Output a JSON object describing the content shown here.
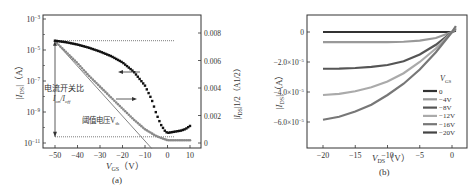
{
  "chart_data": [
    {
      "panel": "(a)",
      "type": "scatter",
      "title": "",
      "xlabel": "V_GS (V)",
      "ylabel_left": "|I_DS| (A)",
      "ylabel_right": "|I_DS|^1/2 (A^1/2)",
      "x_ticks": [
        "-50",
        "-40",
        "-30",
        "-20",
        "-10",
        "0",
        "10"
      ],
      "y_left_ticks": [
        "10^-3",
        "10^-5",
        "10^-7",
        "10^-9",
        "10^-11"
      ],
      "y_right_ticks": [
        "0.008",
        "0.006",
        "0.004",
        "0.002",
        "0"
      ],
      "xlim": [
        -55,
        12
      ],
      "ylim_left_log": [
        -11,
        -3
      ],
      "ylim_right": [
        -0.0003,
        0.0088
      ],
      "annotations": [
        "电流开关比",
        "I_on/I_off",
        "阈值电压V_th"
      ],
      "series": [
        {
          "name": "|I_DS| (log, left axis)",
          "marker": "square-black",
          "x": [
            -50,
            -45,
            -40,
            -35,
            -30,
            -25,
            -20,
            -15,
            -10,
            -7,
            -5,
            -3,
            -1,
            0,
            2,
            4,
            6,
            8,
            10
          ],
          "log10_y": [
            -4.4,
            -4.5,
            -4.65,
            -4.85,
            -5.1,
            -5.4,
            -5.8,
            -6.4,
            -7.3,
            -8.2,
            -9.1,
            -9.8,
            -10.25,
            -10.35,
            -10.3,
            -10.25,
            -10.2,
            -10.1,
            -9.9
          ]
        },
        {
          "name": "|I_DS|^1/2 (linear, right axis)",
          "marker": "circle-grey",
          "x": [
            -50,
            -45,
            -40,
            -35,
            -30,
            -25,
            -20,
            -15,
            -10,
            -5,
            0,
            5,
            10
          ],
          "values": [
            0.0074,
            0.0066,
            0.0058,
            0.0049,
            0.0041,
            0.0033,
            0.0025,
            0.0017,
            0.001,
            0.0005,
            0.0002,
            0.0002,
            0.0002
          ]
        }
      ],
      "reference_lines": {
        "I_on_level_log10": -4.4,
        "I_off_level_log10": -10.6,
        "threshold_voltage_x_intercept": -10
      }
    },
    {
      "panel": "(b)",
      "type": "line",
      "title": "",
      "xlabel": "V_DS (V)",
      "ylabel": "|I_DS| (A)",
      "x_ticks": [
        "-20",
        "-15",
        "-10",
        "-5",
        "0"
      ],
      "y_ticks": [
        "0",
        "-2.0×10^-5",
        "-4.0×10^-5",
        "-6.0×10^-5"
      ],
      "xlim": [
        -22.5,
        1
      ],
      "ylim": [
        -6.8e-05,
        1.15e-05
      ],
      "legend_title": "V_GS",
      "legend_position": "lower right",
      "x": [
        -20,
        -17.5,
        -15,
        -12.5,
        -10,
        -7.5,
        -5,
        -2.5,
        0
      ],
      "series": [
        {
          "name": "0",
          "color": "#333333",
          "values": [
            0,
            0,
            0,
            0,
            0,
            0,
            0,
            0,
            0
          ]
        },
        {
          "name": "-4V",
          "color": "#999999",
          "values": [
            -6.8e-06,
            -6.8e-06,
            -6.8e-06,
            -6.8e-06,
            -6.7e-06,
            -6.5e-06,
            -5.8e-06,
            -4e-06,
            0
          ]
        },
        {
          "name": "-8V",
          "color": "#555555",
          "values": [
            -2.45e-05,
            -2.44e-05,
            -2.4e-05,
            -2.33e-05,
            -2.2e-05,
            -1.95e-05,
            -1.5e-05,
            -8.5e-06,
            0
          ]
        },
        {
          "name": "-12V",
          "color": "#aaaaaa",
          "values": [
            -4.2e-05,
            -4.12e-05,
            -3.95e-05,
            -3.68e-05,
            -3.3e-05,
            -2.75e-05,
            -2e-05,
            -1.1e-05,
            0
          ]
        },
        {
          "name": "-16V",
          "color": "#777777",
          "values": [
            -5.85e-05,
            -5.65e-05,
            -5.3e-05,
            -4.85e-05,
            -4.2e-05,
            -3.45e-05,
            -2.5e-05,
            -1.35e-05,
            0
          ]
        },
        {
          "name": "-20V",
          "color": "#444444",
          "values": []
        }
      ]
    }
  ],
  "labels": {
    "panel_a": "(a)",
    "panel_b": "(b)",
    "a_xlabel_main": "V",
    "a_xlabel_sub": "GS",
    "a_xlabel_unit": "（V）",
    "a_ylabel_left": "|I",
    "a_ylabel_left_sub": "DS",
    "a_ylabel_left_unit": "|（A）",
    "a_ylabel_right": "|I",
    "a_ylabel_right_sub": "DS",
    "a_ylabel_right_unit": "|1/2（A1/2）",
    "b_xlabel_main": "V",
    "b_xlabel_sub": "DS",
    "b_xlabel_unit": "（V）",
    "b_ylabel": "|I",
    "b_ylabel_sub": "DS",
    "b_ylabel_unit": "|（A）",
    "annot_ratio_1": "电流开关比",
    "annot_ratio_2": "I",
    "annot_ratio_2b": "on",
    "annot_ratio_2c": "/I",
    "annot_ratio_2d": "off",
    "annot_vth": "阈值电压V",
    "annot_vth_sub": "th",
    "legend_title": "V",
    "legend_title_sub": "GS"
  }
}
